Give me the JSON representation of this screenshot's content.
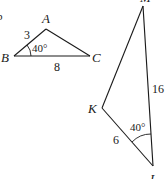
{
  "figure": {
    "left_edge_mark": "b",
    "triangle1": {
      "vertices": [
        "A",
        "B",
        "C"
      ],
      "side_AB": "3",
      "side_BC": "8",
      "angle_B": "40°"
    },
    "triangle2": {
      "vertices": [
        "K",
        "L",
        "M"
      ],
      "side_KL": "6",
      "side_LM": "16",
      "angle_L": "40°"
    }
  }
}
